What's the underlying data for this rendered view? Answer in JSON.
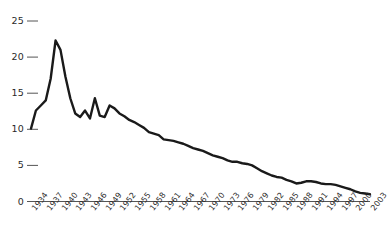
{
  "chart_data": {
    "type": "line",
    "title": "",
    "subtitle": "",
    "xlabel": "",
    "ylabel": "",
    "grid": false,
    "legend": "none",
    "line_color": "#1a1a1a",
    "axis_color": "#555555",
    "label_color": "#2a2a2a",
    "xlim": [
      1934,
      2003
    ],
    "ylim": [
      0,
      25
    ],
    "yticks": [
      0,
      5,
      10,
      15,
      20,
      25
    ],
    "ytick_labels": [
      "0",
      "5",
      "10",
      "15",
      "20",
      "25"
    ],
    "xticks": [
      1934,
      1937,
      1940,
      1943,
      1946,
      1949,
      1952,
      1955,
      1958,
      1961,
      1964,
      1967,
      1970,
      1973,
      1976,
      1979,
      1982,
      1985,
      1988,
      1991,
      1994,
      1997,
      2000,
      2003
    ],
    "xtick_labels": [
      "1934",
      "1937",
      "1940",
      "1943",
      "1946",
      "1949",
      "1952",
      "1955",
      "1958",
      "1961",
      "1964",
      "1967",
      "1970",
      "1973",
      "1976",
      "1979",
      "1982",
      "1985",
      "1988",
      "1991",
      "1994",
      "1997",
      "2000",
      "2003"
    ],
    "x": [
      1934,
      1935,
      1936,
      1937,
      1938,
      1939,
      1940,
      1941,
      1942,
      1943,
      1944,
      1945,
      1946,
      1947,
      1948,
      1949,
      1950,
      1951,
      1952,
      1953,
      1954,
      1955,
      1956,
      1957,
      1958,
      1959,
      1960,
      1961,
      1962,
      1963,
      1964,
      1965,
      1966,
      1967,
      1968,
      1969,
      1970,
      1971,
      1972,
      1973,
      1974,
      1975,
      1976,
      1977,
      1978,
      1979,
      1980,
      1981,
      1982,
      1983,
      1984,
      1985,
      1986,
      1987,
      1988,
      1989,
      1990,
      1991,
      1992,
      1993,
      1994,
      1995,
      1996,
      1997,
      1998,
      1999,
      2000,
      2001,
      2002,
      2003
    ],
    "values": [
      10.1,
      12.6,
      13.3,
      14.0,
      17.0,
      22.3,
      21.0,
      17.3,
      14.3,
      12.2,
      11.7,
      12.6,
      11.5,
      14.3,
      11.9,
      11.7,
      13.3,
      12.9,
      12.2,
      11.8,
      11.3,
      11.0,
      10.6,
      10.2,
      9.6,
      9.4,
      9.2,
      8.6,
      8.5,
      8.4,
      8.2,
      8.0,
      7.7,
      7.4,
      7.2,
      7.0,
      6.7,
      6.4,
      6.2,
      6.0,
      5.7,
      5.5,
      5.5,
      5.3,
      5.2,
      5.0,
      4.6,
      4.2,
      3.9,
      3.6,
      3.4,
      3.3,
      3.0,
      2.8,
      2.5,
      2.6,
      2.8,
      2.8,
      2.7,
      2.5,
      2.4,
      2.4,
      2.3,
      2.1,
      1.9,
      1.7,
      1.4,
      1.2,
      1.1,
      1.0
    ]
  }
}
